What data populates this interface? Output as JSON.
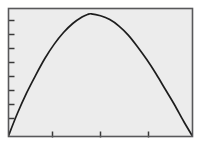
{
  "figure": {
    "background_color": "#ffffff",
    "plot_area_fill": "#ececec",
    "frame_color": "#58585a",
    "curve_color": "#1d1d1d",
    "tick_color": "#3a3a3a",
    "frame": {
      "x": 8,
      "y": 8,
      "width": 185,
      "height": 129
    },
    "title": "",
    "xlabel": "",
    "ylabel": ""
  },
  "axes": {
    "y_ticks_px": [
      20,
      34,
      48,
      62,
      76,
      90,
      104,
      118
    ],
    "y_tick_length": 6,
    "x_ticks_px": [
      52,
      100,
      148
    ],
    "x_tick_length": 6,
    "x_tick_labels": [],
    "y_tick_labels": []
  },
  "chart_data": {
    "type": "line",
    "title": "",
    "subtitle": "",
    "xlabel": "",
    "ylabel": "",
    "grid": false,
    "legend": [],
    "legend_position": "none",
    "xlim": [
      0,
      1
    ],
    "ylim": [
      0,
      1
    ],
    "series": [
      {
        "name": "curve",
        "color": "#1d1d1d",
        "x": [
          0.0,
          0.05,
          0.1,
          0.15,
          0.2,
          0.25,
          0.3,
          0.35,
          0.4,
          0.43,
          0.45,
          0.5,
          0.55,
          0.6,
          0.65,
          0.7,
          0.75,
          0.8,
          0.85,
          0.9,
          0.95,
          1.0
        ],
        "y": [
          0.0,
          0.18,
          0.34,
          0.48,
          0.61,
          0.72,
          0.81,
          0.88,
          0.93,
          0.95,
          0.955,
          0.94,
          0.91,
          0.86,
          0.79,
          0.7,
          0.6,
          0.49,
          0.37,
          0.25,
          0.12,
          0.0
        ]
      }
    ],
    "annotations": []
  }
}
